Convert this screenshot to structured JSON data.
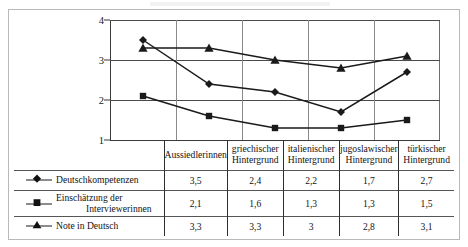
{
  "chart_data": {
    "type": "line",
    "title": "",
    "xlabel": "",
    "ylabel": "",
    "ylim": [
      1,
      4
    ],
    "yticks": [
      "1",
      "2",
      "3",
      "4"
    ],
    "grid": true,
    "legend_position": "table-left",
    "categories": [
      "Aussiedlerinnen",
      "griechischer Hintergrund",
      "italienischer Hintergrund",
      "jugoslawischer Hintergrund",
      "türkischer Hintergrund"
    ],
    "series": [
      {
        "name": "Deutschkompetenzen",
        "marker": "diamond",
        "values": [
          3.5,
          2.4,
          2.2,
          1.7,
          2.7
        ],
        "labels": [
          "3,5",
          "2,4",
          "2,2",
          "1,7",
          "2,7"
        ]
      },
      {
        "name": "Einschätzung der Interviewerinnen",
        "marker": "square",
        "values": [
          2.1,
          1.6,
          1.3,
          1.3,
          1.5
        ],
        "labels": [
          "2,1",
          "1,6",
          "1,3",
          "1,3",
          "1,5"
        ]
      },
      {
        "name": "Note in Deutsch",
        "marker": "triangle",
        "values": [
          3.3,
          3.3,
          3.0,
          2.8,
          3.1
        ],
        "labels": [
          "3,3",
          "3,3",
          "3",
          "2,8",
          "3,1"
        ]
      }
    ]
  },
  "table": {
    "header_cells": [
      {
        "line1": "Aussiedlerinnen",
        "line2": ""
      },
      {
        "line1": "griechischer",
        "line2": "Hintergrund"
      },
      {
        "line1": "italienischer",
        "line2": "Hintergrund"
      },
      {
        "line1": "jugoslawischer",
        "line2": "Hintergrund"
      },
      {
        "line1": "türkischer",
        "line2": "Hintergrund"
      }
    ],
    "rows": [
      {
        "legend_line1": "Deutschkompetenzen",
        "legend_line2": "",
        "marker": "diamond",
        "values": [
          "3,5",
          "2,4",
          "2,2",
          "1,7",
          "2,7"
        ]
      },
      {
        "legend_line1": "Einschätzung der",
        "legend_line2": "Interviewerinnen",
        "marker": "square",
        "values": [
          "2,1",
          "1,6",
          "1,3",
          "1,3",
          "1,5"
        ]
      },
      {
        "legend_line1": "Note in Deutsch",
        "legend_line2": "",
        "marker": "triangle",
        "values": [
          "3,3",
          "3,3",
          "3",
          "2,8",
          "3,1"
        ]
      }
    ]
  },
  "colors": {
    "line": "#1a1a1a",
    "grid": "#4a4a4a",
    "axis": "#3a3a3a",
    "frame": "#b9b9b9",
    "text": "#141414"
  }
}
